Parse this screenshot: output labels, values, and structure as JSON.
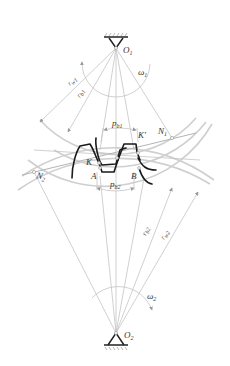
{
  "diagram": {
    "title": "",
    "type": "involute gear meshing diagram",
    "labels": {
      "o1": "O",
      "o1_sub": "1",
      "o2": "O",
      "o2_sub": "2",
      "omega1": "ω",
      "omega1_sub": "1",
      "omega2": "ω",
      "omega2_sub": "2",
      "rw1": "r",
      "rw1_sub": "w1",
      "rb1": "r",
      "rb1_sub": "b1",
      "rb2": "r",
      "rb2_sub": "b2",
      "rw2": "r",
      "rw2_sub": "w2",
      "pb1": "p",
      "pb1_sub": "b1",
      "pb2": "p",
      "pb2_sub": "b2",
      "n1": "N",
      "n1_sub": "1",
      "n2": "N",
      "n2_sub": "2",
      "k": "K",
      "k_prime": "K′",
      "a": "A",
      "b": "B"
    },
    "nodes": [
      {
        "id": "O1",
        "desc": "center of gear 1 (fixed pivot, top)"
      },
      {
        "id": "O2",
        "desc": "center of gear 2 (fixed pivot, bottom)"
      },
      {
        "id": "N1",
        "desc": "tangent point of line of action on base circle 1"
      },
      {
        "id": "N2",
        "desc": "tangent point of line of action on base circle 2"
      },
      {
        "id": "K",
        "desc": "contact point"
      },
      {
        "id": "K'",
        "desc": "contact point"
      },
      {
        "id": "A",
        "desc": "point on base circle 2"
      },
      {
        "id": "B",
        "desc": "point on base circle 2"
      }
    ],
    "edges": [
      {
        "from": "N2",
        "to": "N1",
        "desc": "line of action"
      },
      {
        "from": "O1",
        "to": "O2",
        "desc": "center line"
      },
      {
        "from": "O1",
        "to": "N1",
        "desc": "base radius rb1"
      },
      {
        "from": "O2",
        "to": "N2",
        "desc": "base radius rb2"
      }
    ]
  }
}
